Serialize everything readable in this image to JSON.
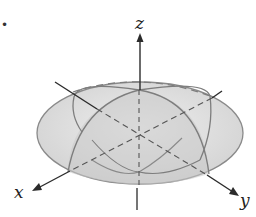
{
  "figure": {
    "bullet": "•",
    "axes": {
      "x_label": "x",
      "y_label": "y",
      "z_label": "z"
    },
    "colors": {
      "surface_fill": "#d9d9d9",
      "outline": "#7a7a7a",
      "axis": "#2b2b2b"
    }
  }
}
